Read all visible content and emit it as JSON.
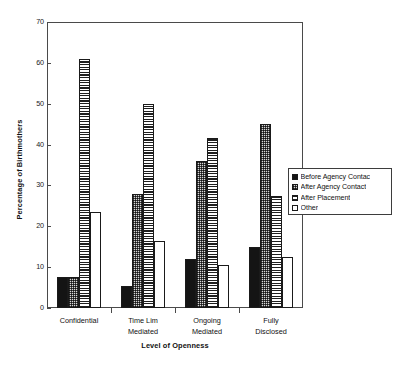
{
  "chart_data": {
    "type": "bar",
    "title": "",
    "subtitle": "",
    "xlabel": "Level of Openness",
    "ylabel": "Percentage of Birthmothers",
    "ylim": [
      0,
      70
    ],
    "yticks": [
      0,
      10,
      20,
      30,
      40,
      50,
      60,
      70
    ],
    "ytick_labels": [
      "0",
      "10",
      "20",
      "30",
      "40",
      "50",
      "60",
      "70"
    ],
    "grid": false,
    "legend_position": "right-inside",
    "categories": [
      "Confidential",
      "Time Lim Mediated",
      "Ongoing Mediated",
      "Fully Disclosed"
    ],
    "category_lines": [
      [
        "Confidential"
      ],
      [
        "Time Lim",
        "Mediated"
      ],
      [
        "Ongoing",
        "Mediated"
      ],
      [
        "Fully",
        "Disclosed"
      ]
    ],
    "series": [
      {
        "name": "Before Agency Contac",
        "pattern": "solid-black",
        "values": [
          7.5,
          5.5,
          12,
          15
        ]
      },
      {
        "name": "After Agency Contact",
        "pattern": "dotted-grey",
        "values": [
          7.5,
          28,
          36,
          45
        ]
      },
      {
        "name": "After Placement",
        "pattern": "horizontal-lines",
        "values": [
          61,
          50,
          41.5,
          27.5
        ]
      },
      {
        "name": "Other",
        "pattern": "empty-white",
        "values": [
          23.5,
          16.5,
          10.5,
          12.5
        ]
      }
    ],
    "annotations": []
  },
  "legend": {
    "items": [
      {
        "label": "Before Agency Contac",
        "swatch": "solid-black"
      },
      {
        "label": "After Agency Contact",
        "swatch": "dotted-grey"
      },
      {
        "label": "After Placement",
        "swatch": "horizontal-lines"
      },
      {
        "label": "Other",
        "swatch": "empty-white"
      }
    ]
  },
  "colors": {
    "axis": "#4a4a4a",
    "text": "#111111",
    "bar_outline": "#1a1a1a",
    "series_solid": "#141414",
    "series_dots": "#d8d8d8",
    "series_lines": "#1f1f1f",
    "series_empty": "#ffffff",
    "background": "#ffffff"
  }
}
